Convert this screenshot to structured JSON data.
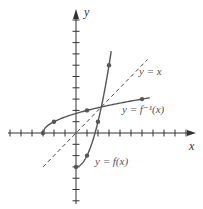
{
  "chart_data": {
    "type": "line",
    "title": "",
    "xlabel": "x",
    "ylabel": "y",
    "xlim": [
      -6,
      10
    ],
    "ylim": [
      -6,
      10
    ],
    "x_ticks": [
      -6,
      -5,
      -4,
      -3,
      -2,
      -1,
      1,
      2,
      3,
      4,
      5,
      6,
      7,
      8,
      9,
      10
    ],
    "y_ticks": [
      -6,
      -5,
      -4,
      -3,
      -2,
      -1,
      1,
      2,
      3,
      4,
      5,
      6,
      7,
      8,
      9,
      10
    ],
    "grid": false,
    "colors": {
      "curve": "#555555",
      "axis": "#333333",
      "dashed": "#333333",
      "label": "#555555"
    },
    "series": [
      {
        "name": "y = f(x)",
        "label": "y = f(x)",
        "style": "solid",
        "points": [
          [
            0,
            -3
          ],
          [
            1,
            -2
          ],
          [
            2,
            1
          ],
          [
            3,
            6
          ]
        ],
        "curve_extent": [
          [
            0,
            -3
          ],
          [
            3.2,
            7.2
          ]
        ]
      },
      {
        "name": "y = f⁻¹(x)",
        "label": "y = f⁻¹(x)",
        "style": "solid",
        "points": [
          [
            -3,
            0
          ],
          [
            -2,
            1
          ],
          [
            1,
            2
          ],
          [
            6,
            3
          ]
        ],
        "curve_extent": [
          [
            -3,
            0
          ],
          [
            6.7,
            3.2
          ]
        ]
      },
      {
        "name": "y = x",
        "label": "y = x",
        "style": "dashed",
        "points": [
          [
            -3,
            -3
          ],
          [
            6.5,
            6.5
          ]
        ]
      }
    ]
  }
}
